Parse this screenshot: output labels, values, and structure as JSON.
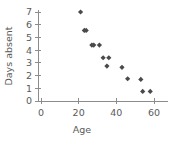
{
  "chart_data": {
    "type": "scatter",
    "title": "",
    "xlabel": "Age",
    "ylabel": "Days absent",
    "xlim": [
      0,
      63
    ],
    "ylim": [
      0,
      7.4
    ],
    "xticks": [
      0,
      20,
      40,
      60
    ],
    "xtick_labels": [
      "0",
      "20",
      "40",
      "60"
    ],
    "yticks": [
      0,
      1,
      2,
      3,
      4,
      5,
      6,
      7
    ],
    "ytick_labels": [
      "0",
      "1",
      "2",
      "3",
      "4",
      "5",
      "6",
      "7"
    ],
    "grid": false,
    "legend": false,
    "marker_color": "#4a4a4a",
    "axis_color": "#8c8c8c",
    "points": [
      {
        "x": 21,
        "y": 7.0
      },
      {
        "x": 23,
        "y": 5.55
      },
      {
        "x": 24,
        "y": 5.55
      },
      {
        "x": 27,
        "y": 4.4
      },
      {
        "x": 28,
        "y": 4.4
      },
      {
        "x": 31,
        "y": 4.4
      },
      {
        "x": 33,
        "y": 3.4
      },
      {
        "x": 36,
        "y": 3.4
      },
      {
        "x": 35,
        "y": 2.75
      },
      {
        "x": 43,
        "y": 2.65
      },
      {
        "x": 46,
        "y": 1.75
      },
      {
        "x": 53,
        "y": 1.7
      },
      {
        "x": 54,
        "y": 0.75
      },
      {
        "x": 58,
        "y": 0.75
      }
    ]
  },
  "axes": {
    "x_label": "Age",
    "y_label": "Days absent"
  }
}
